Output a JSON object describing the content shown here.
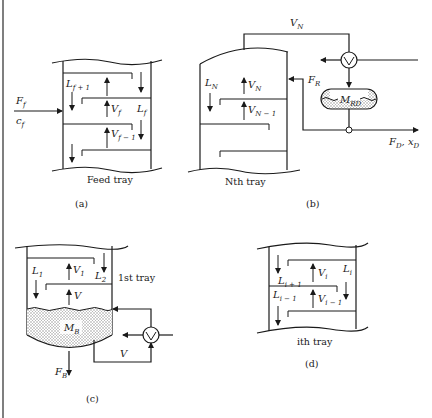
{
  "figure": {
    "panels": [
      {
        "id": "a",
        "caption": "(a)",
        "title": "Feed tray",
        "labels": {
          "feed_flow": "F",
          "feed_flow_sub": "f",
          "feed_comp": "c",
          "feed_comp_sub": "f",
          "liquid_above": "L",
          "liquid_above_sub": "f + 1",
          "vapor": "V",
          "vapor_sub": "f",
          "liquid": "L",
          "liquid_sub": "f",
          "vapor_below": "V",
          "vapor_below_sub": "f − 1"
        }
      },
      {
        "id": "b",
        "caption": "(b)",
        "title": "Nth tray",
        "labels": {
          "overhead_vapor": "V",
          "overhead_vapor_sub": "N",
          "liquid": "L",
          "liquid_sub": "N",
          "vapor": "V",
          "vapor_sub": "N",
          "vapor_below": "V",
          "vapor_below_sub": "N − 1",
          "reflux": "F",
          "reflux_sub": "R",
          "drum_holdup": "M",
          "drum_holdup_sub": "RD",
          "distillate": "F",
          "distillate_sub": "D",
          "distillate_comp": "x",
          "distillate_comp_sub": "D"
        }
      },
      {
        "id": "c",
        "caption": "(c)",
        "title": "1st tray",
        "labels": {
          "liquid_1": "L",
          "liquid_1_sub": "1",
          "vapor_1": "V",
          "vapor_1_sub": "1",
          "liquid_2": "L",
          "liquid_2_sub": "2",
          "boilup": "V",
          "reboiler_vapor": "V",
          "base_holdup": "M",
          "base_holdup_sub": "B",
          "bottoms": "F",
          "bottoms_sub": "B"
        }
      },
      {
        "id": "d",
        "caption": "(d)",
        "title": "ith tray",
        "labels": {
          "liquid_above": "L",
          "liquid_above_sub": "i + 1",
          "vapor": "V",
          "vapor_sub": "i",
          "liquid": "L",
          "liquid_sub": "i",
          "liquid_below": "L",
          "liquid_below_sub": "i − 1",
          "vapor_below": "V",
          "vapor_below_sub": "i − 1"
        }
      }
    ]
  },
  "colors": {
    "ink": "#1a1a1a",
    "paper": "#ffffff",
    "stipple": "#9a9a9a"
  }
}
